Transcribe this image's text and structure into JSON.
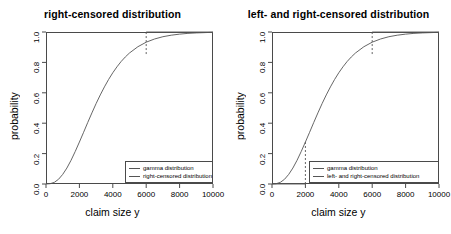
{
  "figure": {
    "width": 451,
    "height": 234,
    "background": "#ffffff",
    "curve_color": "#555555",
    "axis_color": "#4a4a4a"
  },
  "panels": [
    {
      "id": "right-censored",
      "title": "right-censored distribution",
      "xlabel": "claim size y",
      "ylabel": "probability",
      "legend": [
        {
          "label": "gamma distribution",
          "color": "#555555",
          "style": "solid"
        },
        {
          "label": "right-censored distribution",
          "color": "#555555",
          "style": "solid"
        }
      ]
    },
    {
      "id": "left-and-right-censored",
      "title": "left- and right-censored distribution",
      "xlabel": "claim size y",
      "ylabel": "probability",
      "legend": [
        {
          "label": "gamma distribution",
          "color": "#555555",
          "style": "solid"
        },
        {
          "label": "left- and right-censored distribution",
          "color": "#555555",
          "style": "solid"
        }
      ]
    }
  ],
  "chart_data": [
    {
      "type": "line",
      "id": "right-censored",
      "title": "right-censored distribution",
      "xlabel": "claim size y",
      "ylabel": "probability",
      "xlim": [
        0,
        10000
      ],
      "ylim": [
        0,
        1
      ],
      "xticks": [
        0,
        2000,
        4000,
        6000,
        8000,
        10000
      ],
      "xticklabels": [
        "0",
        "2000",
        "4000",
        "6000",
        "8000",
        "10000"
      ],
      "yticks": [
        0.0,
        0.2,
        0.4,
        0.6,
        0.8,
        1.0
      ],
      "yticklabels": [
        "0.0",
        "0.2",
        "0.4",
        "0.6",
        "0.8",
        "1.0"
      ],
      "grid": false,
      "legend_position": "lower right",
      "censoring": {
        "right_threshold": 6000,
        "cdf_at_right_threshold": 0.855
      },
      "series": [
        {
          "name": "gamma distribution",
          "style": "solid",
          "color": "#555555",
          "x": [
            0,
            250,
            500,
            750,
            1000,
            1250,
            1500,
            1750,
            2000,
            2250,
            2500,
            2750,
            3000,
            3250,
            3500,
            3750,
            4000,
            4250,
            4500,
            4750,
            5000,
            5500,
            6000,
            6500,
            7000,
            7500,
            8000,
            8500,
            9000,
            9500,
            10000
          ],
          "y": [
            0.0,
            0.002,
            0.011,
            0.031,
            0.063,
            0.105,
            0.156,
            0.214,
            0.276,
            0.34,
            0.405,
            0.468,
            0.529,
            0.586,
            0.639,
            0.688,
            0.732,
            0.771,
            0.806,
            0.836,
            0.862,
            0.903,
            0.933,
            0.954,
            0.969,
            0.979,
            0.986,
            0.991,
            0.994,
            0.996,
            0.998
          ]
        },
        {
          "name": "right-censored distribution",
          "style": "solid-with-dashed-jump",
          "color": "#555555",
          "description": "Equals gamma CDF for y < 6000, jumps vertically (dashed) to 1.0 at y = 6000 and stays at 1.0 thereafter.",
          "x": [
            6000,
            6000,
            10000
          ],
          "y": [
            0.855,
            1.0,
            1.0
          ]
        }
      ]
    },
    {
      "type": "line",
      "id": "left-and-right-censored",
      "title": "left- and right-censored distribution",
      "xlabel": "claim size y",
      "ylabel": "probability",
      "xlim": [
        0,
        10000
      ],
      "ylim": [
        0,
        1
      ],
      "xticks": [
        0,
        2000,
        4000,
        6000,
        8000,
        10000
      ],
      "xticklabels": [
        "0",
        "2000",
        "4000",
        "6000",
        "8000",
        "10000"
      ],
      "yticks": [
        0.0,
        0.2,
        0.4,
        0.6,
        0.8,
        1.0
      ],
      "yticklabels": [
        "0.0",
        "0.2",
        "0.4",
        "0.6",
        "0.8",
        "1.0"
      ],
      "grid": false,
      "legend_position": "lower right",
      "censoring": {
        "left_threshold": 2000,
        "right_threshold": 6000,
        "cdf_at_left_threshold": 0.276,
        "cdf_at_right_threshold": 0.855
      },
      "series": [
        {
          "name": "gamma distribution",
          "style": "solid",
          "color": "#555555",
          "x": [
            0,
            250,
            500,
            750,
            1000,
            1250,
            1500,
            1750,
            2000,
            2250,
            2500,
            2750,
            3000,
            3250,
            3500,
            3750,
            4000,
            4250,
            4500,
            4750,
            5000,
            5500,
            6000,
            6500,
            7000,
            7500,
            8000,
            8500,
            9000,
            9500,
            10000
          ],
          "y": [
            0.0,
            0.002,
            0.011,
            0.031,
            0.063,
            0.105,
            0.156,
            0.214,
            0.276,
            0.34,
            0.405,
            0.468,
            0.529,
            0.586,
            0.639,
            0.688,
            0.732,
            0.771,
            0.806,
            0.836,
            0.862,
            0.903,
            0.933,
            0.954,
            0.969,
            0.979,
            0.986,
            0.991,
            0.994,
            0.996,
            0.998
          ]
        },
        {
          "name": "left- and right-censored distribution",
          "style": "solid-with-dashed-jumps",
          "color": "#555555",
          "description": "Flat at 0 for y < 2000, dashed vertical jump to the gamma CDF at y = 2000, follows gamma CDF up to y = 6000, then dashed vertical jump to 1.0 and flat at 1.0.",
          "x": [
            0,
            2000,
            2000,
            6000,
            6000,
            10000
          ],
          "y": [
            0.0,
            0.0,
            0.276,
            0.855,
            1.0,
            1.0
          ]
        }
      ]
    }
  ]
}
